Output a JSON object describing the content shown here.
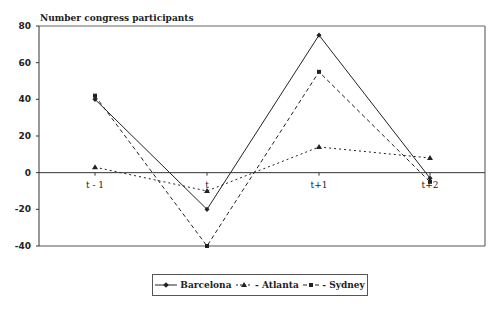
{
  "chart_data": {
    "type": "line",
    "title": "",
    "ylabel": "Number congress participants",
    "xlabel": "",
    "categories": [
      "t - 1",
      "t",
      "t+1",
      "t+2"
    ],
    "series": [
      {
        "name": "Barcelona",
        "values": [
          40,
          -20,
          75,
          -3
        ],
        "style": "solid",
        "marker": "diamond"
      },
      {
        "name": "Atlanta",
        "values": [
          3,
          -10,
          14,
          8
        ],
        "style": "dotted",
        "marker": "triangle"
      },
      {
        "name": "Sydney",
        "values": [
          42,
          -40,
          55,
          -5
        ],
        "style": "dashed",
        "marker": "square"
      }
    ],
    "ylim": [
      -40,
      80
    ],
    "yticks": [
      80,
      60,
      40,
      20,
      0,
      -20,
      -40
    ],
    "grid": false,
    "legend_position": "bottom"
  },
  "legend": {
    "items": [
      {
        "label": "Barcelona"
      },
      {
        "label": "- Atlanta"
      },
      {
        "label": "- Sydney"
      }
    ]
  }
}
